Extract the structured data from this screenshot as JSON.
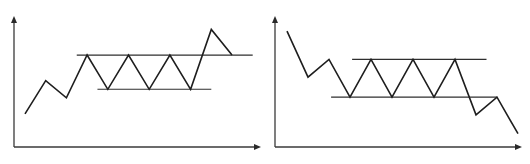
{
  "chart_data": [
    {
      "type": "line",
      "title": "",
      "description": "Rectangle range followed by upside breakout",
      "xlabel": "",
      "ylabel": "",
      "ylim": [
        0,
        100
      ],
      "grid": false,
      "series": [
        {
          "name": "price",
          "x": [
            0,
            1,
            2,
            3,
            4,
            5,
            6,
            7,
            8,
            9,
            10
          ],
          "values": [
            16,
            47,
            31,
            71,
            39,
            71,
            39,
            71,
            39,
            95,
            71
          ]
        }
      ],
      "levels": [
        {
          "name": "resistance",
          "value": 71,
          "x_range": [
            2.5,
            11
          ]
        },
        {
          "name": "support",
          "value": 39,
          "x_range": [
            3.5,
            9
          ]
        }
      ]
    },
    {
      "type": "line",
      "title": "",
      "description": "Rectangle range followed by downside breakdown",
      "xlabel": "",
      "ylabel": "",
      "ylim": [
        0,
        100
      ],
      "grid": false,
      "series": [
        {
          "name": "price",
          "x": [
            0,
            1,
            2,
            3,
            4,
            5,
            6,
            7,
            8,
            9,
            10,
            11
          ],
          "values": [
            94,
            55,
            70,
            38,
            70,
            38,
            70,
            38,
            70,
            23,
            38,
            7
          ]
        }
      ],
      "levels": [
        {
          "name": "resistance",
          "value": 70,
          "x_range": [
            3.1,
            9.5
          ]
        },
        {
          "name": "support",
          "value": 38,
          "x_range": [
            2.1,
            10
          ]
        }
      ]
    }
  ]
}
